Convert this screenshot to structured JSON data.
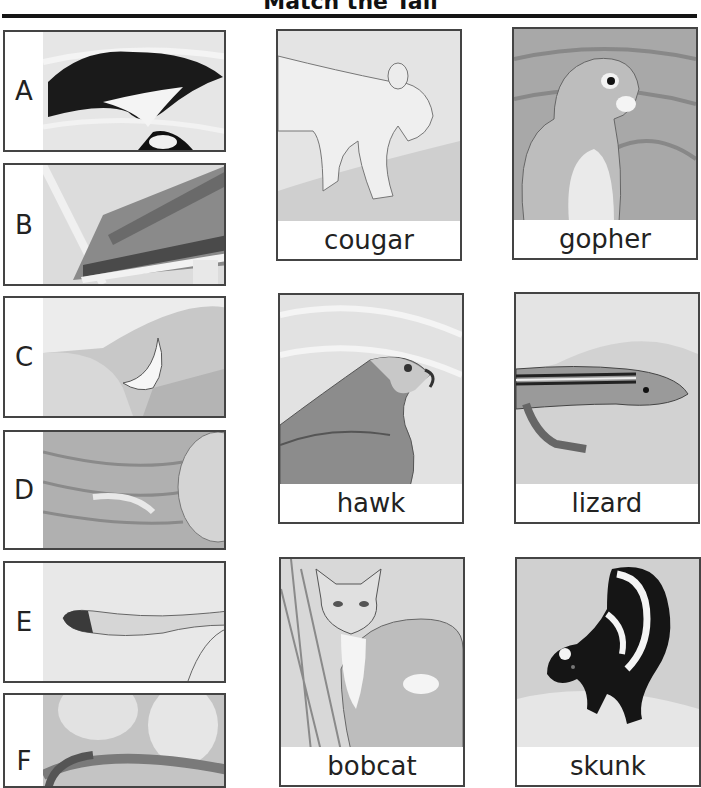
{
  "title": "Match the Tail",
  "tails": [
    {
      "letter": "A",
      "icon": "skunk-tail-icon"
    },
    {
      "letter": "B",
      "icon": "hawk-tail-icon"
    },
    {
      "letter": "C",
      "icon": "lizard-tail-icon"
    },
    {
      "letter": "D",
      "icon": "gopher-tail-icon"
    },
    {
      "letter": "E",
      "icon": "cougar-tail-icon"
    },
    {
      "letter": "F",
      "icon": "bobcat-tail-icon"
    }
  ],
  "animals": [
    {
      "name": "cougar",
      "icon": "cougar-illustration"
    },
    {
      "name": "gopher",
      "icon": "gopher-illustration"
    },
    {
      "name": "hawk",
      "icon": "hawk-illustration"
    },
    {
      "name": "lizard",
      "icon": "lizard-illustration"
    },
    {
      "name": "bobcat",
      "icon": "bobcat-illustration"
    },
    {
      "name": "skunk",
      "icon": "skunk-illustration"
    }
  ]
}
